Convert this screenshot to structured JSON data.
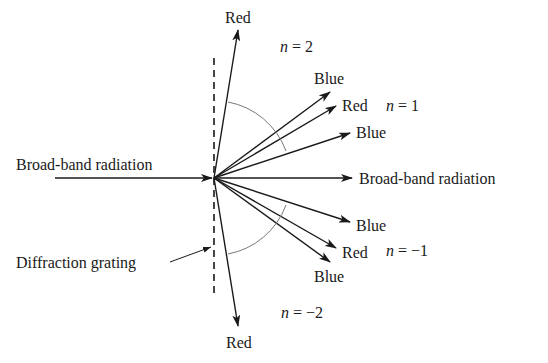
{
  "diagram": {
    "incident_label": "Broad-band radiation",
    "transmitted_label": "Broad-band radiation",
    "grating_label": "Diffraction grating",
    "orders": {
      "n2": {
        "label_var": "n",
        "label_rest": " = 2",
        "beam": "Red"
      },
      "n1": {
        "label_var": "n",
        "label_rest": " = 1",
        "beams": [
          "Blue",
          "Red",
          "Blue"
        ]
      },
      "nm1": {
        "label_var": "n",
        "label_rest": " = −1",
        "beams": [
          "Blue",
          "Red",
          "Blue"
        ]
      },
      "nm2": {
        "label_var": "n",
        "label_rest": " = −2",
        "beam": "Red"
      }
    },
    "colors": {
      "line": "#1a1a1a",
      "arc": "#777777",
      "background": "#ffffff"
    }
  }
}
